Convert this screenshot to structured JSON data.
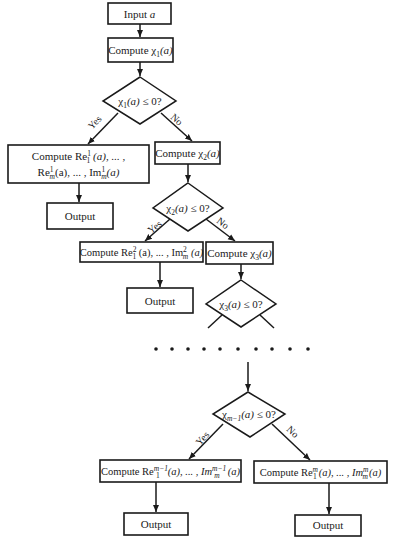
{
  "diagram": {
    "type": "flowchart",
    "nodes": {
      "input": {
        "text": "Input ",
        "var": "a"
      },
      "compute_chi1": {
        "prefix": "Compute χ",
        "sub": "1",
        "arg": "(a)"
      },
      "decision1": {
        "prefix": "χ",
        "sub": "1",
        "arg": "(a)",
        "cond": " ≤ 0?"
      },
      "yes1_line1": {
        "prefix": "Compute Re",
        "sup": "1",
        "sub": "1",
        "rest": " (a), ... ,"
      },
      "yes1_line2": {
        "re": "Re",
        "sup": "1",
        "sub": "m",
        "mid": "(a), ... , Im",
        "sup2": "1",
        "sub2": "m",
        "end": "(a)"
      },
      "output1": {
        "text": "Output"
      },
      "compute_chi2": {
        "prefix": "Compute χ",
        "sub": "2",
        "arg": "(a)"
      },
      "decision2": {
        "prefix": "χ",
        "sub": "2",
        "arg": "(a)",
        "cond": " ≤ 0?"
      },
      "yes2": {
        "prefix": "Compute Re",
        "sup": "2",
        "sub": "1",
        "mid": " (a), ... , Im",
        "sup2": "2",
        "sub2": "m",
        "end": " (a)"
      },
      "output2": {
        "text": "Output"
      },
      "compute_chi3": {
        "prefix": "Compute χ",
        "sub": "3",
        "arg": "(a)"
      },
      "decision3": {
        "prefix": "χ",
        "sub": "3",
        "arg": "(a)",
        "cond": " ≤ 0?"
      },
      "ellipsis": {
        "dots": 10
      },
      "decision_m1": {
        "prefix": "χ",
        "sub": "m−1",
        "arg": "(a)",
        "cond": " ≤ 0?"
      },
      "yes_m1": {
        "prefix": "Compute Re",
        "sup": "m−1",
        "sub": "1",
        "mid": "(a), ... , Im",
        "sup2": "m−1",
        "sub2": "m",
        "end": "(a)"
      },
      "output3": {
        "text": "Output"
      },
      "no_m": {
        "prefix": "Compute Re",
        "sup": "m",
        "sub": "1",
        "mid": "(a), ... , Im",
        "sup2": "m",
        "sub2": "m",
        "end": "(a)"
      },
      "output4": {
        "text": "Output"
      }
    },
    "edge_labels": {
      "yes": "Yes",
      "no": "No"
    }
  }
}
